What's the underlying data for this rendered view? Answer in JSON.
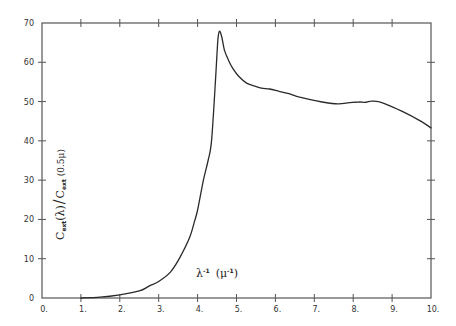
{
  "chart_data": {
    "type": "line",
    "title": "",
    "xlabel": "λ⁻¹ (μ⁻¹)",
    "ylabel": "C_ext(λ) / C_ext(0.5μ)",
    "ylabel_parts": {
      "c1": "C",
      "sub1": "ext",
      "arg1": "(λ)",
      "slash": "/",
      "c2": "C",
      "sub2": "ext",
      "arg2": "(0.5μ)"
    },
    "xlabel_parts": {
      "lambda": "λ",
      "lambda_exp": "-1",
      "unit": "(μ",
      "unit_exp": "-1",
      "unit_close": ")"
    },
    "xlim": [
      0,
      10
    ],
    "ylim": [
      0,
      70
    ],
    "grid": false,
    "legend": null,
    "x_ticks": [
      "0.",
      "1.",
      "2.",
      "3.",
      "4.",
      "5.",
      "6.",
      "7.",
      "8.",
      "9.",
      "10."
    ],
    "y_ticks": [
      "0",
      "10",
      "20",
      "30",
      "40",
      "50",
      "60",
      "70"
    ],
    "series": [
      {
        "name": "extinction curve",
        "x": [
          1.0,
          1.5,
          2.0,
          2.5,
          2.75,
          3.0,
          3.3,
          3.55,
          3.8,
          3.92,
          4.0,
          4.15,
          4.27,
          4.36,
          4.46,
          4.52,
          4.56,
          4.62,
          4.69,
          4.8,
          4.9,
          5.05,
          5.26,
          5.45,
          5.64,
          5.85,
          6.1,
          6.35,
          6.6,
          6.9,
          7.2,
          7.6,
          7.9,
          8.15,
          8.3,
          8.46,
          8.65,
          8.9,
          9.3,
          9.7,
          10.0
        ],
        "y": [
          0.0,
          0.2,
          0.8,
          1.8,
          3.0,
          4.2,
          6.6,
          10.4,
          15.5,
          19.5,
          22.4,
          30.0,
          35.0,
          40.2,
          55.5,
          65.5,
          67.9,
          66.5,
          63.1,
          60.4,
          58.5,
          56.5,
          54.7,
          54.0,
          53.4,
          53.2,
          52.6,
          52.0,
          51.2,
          50.5,
          49.9,
          49.4,
          49.7,
          49.9,
          49.8,
          50.1,
          50.0,
          49.1,
          47.3,
          45.2,
          43.3
        ]
      }
    ],
    "style": {
      "line_color": "#2a2a2a",
      "axis_color": "#555555",
      "background": "#ffffff"
    }
  }
}
